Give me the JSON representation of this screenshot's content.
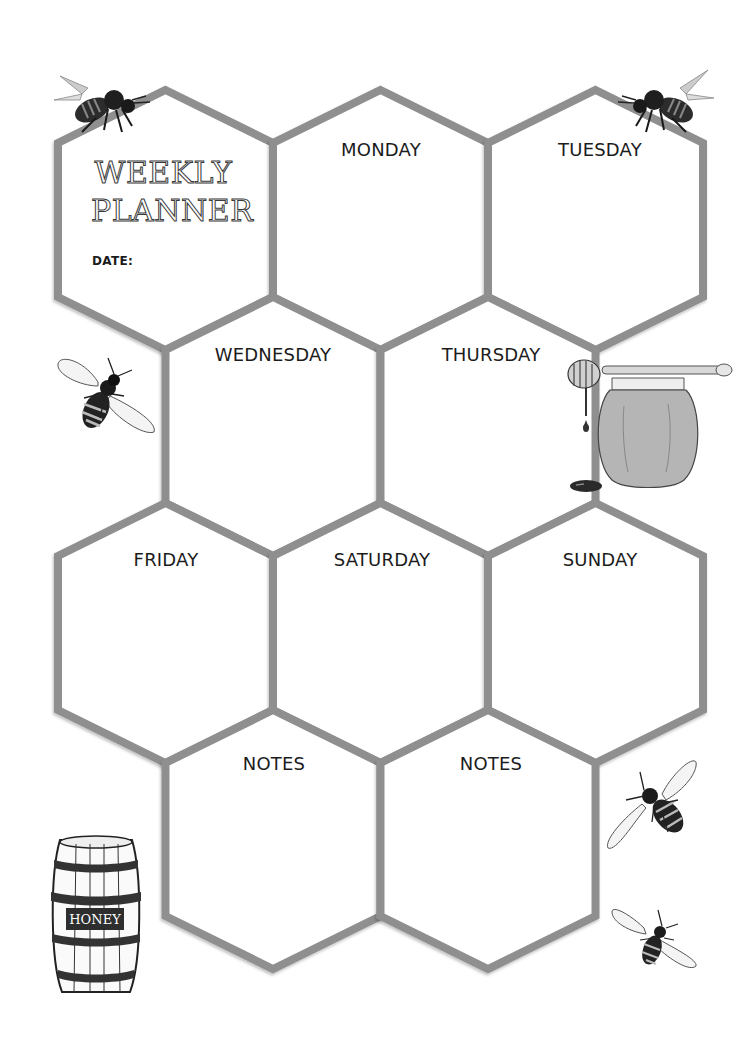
{
  "planner": {
    "title_line1": "WEEKLY",
    "title_line2": "PLANNER",
    "date_label": "DATE:",
    "stroke_color": "#8f8f8f",
    "text_color": "#1c1c1c",
    "cells": [
      {
        "id": "title",
        "label": ""
      },
      {
        "id": "monday",
        "label": "MONDAY"
      },
      {
        "id": "tuesday",
        "label": "TUESDAY"
      },
      {
        "id": "wednesday",
        "label": "WEDNESDAY"
      },
      {
        "id": "thursday",
        "label": "THURSDAY"
      },
      {
        "id": "friday",
        "label": "FRIDAY"
      },
      {
        "id": "saturday",
        "label": "SATURDAY"
      },
      {
        "id": "sunday",
        "label": "SUNDAY"
      },
      {
        "id": "notes-1",
        "label": "NOTES"
      },
      {
        "id": "notes-2",
        "label": "NOTES"
      }
    ]
  },
  "decorations": {
    "barrel_label": "HONEY",
    "items": [
      "bee-top-left",
      "bee-top-right",
      "bee-left",
      "honey-jar-with-dipper",
      "honey-barrel",
      "bee-bottom-right-1",
      "bee-bottom-right-2"
    ]
  }
}
